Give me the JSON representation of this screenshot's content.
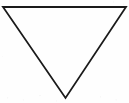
{
  "image": {
    "width": 129,
    "height": 103,
    "background_color": "#fefefe",
    "description": "Line drawing of an inverted triangle"
  },
  "figure": {
    "name": "inverted-triangle",
    "shape": "triangle",
    "orientation": "point-down",
    "fill": "none",
    "fill_color": "#ffffff",
    "stroke_color": "#1a1a1a",
    "stroke_width": 1.8,
    "vertices": [
      {
        "label": "top-left",
        "x": 3,
        "y": 7
      },
      {
        "label": "top-right",
        "x": 126,
        "y": 7
      },
      {
        "label": "bottom-apex",
        "x": 65.5,
        "y": 98
      }
    ],
    "points_attr": "3,7 126,7 65.5,98"
  },
  "labels": {
    "caption": ""
  }
}
